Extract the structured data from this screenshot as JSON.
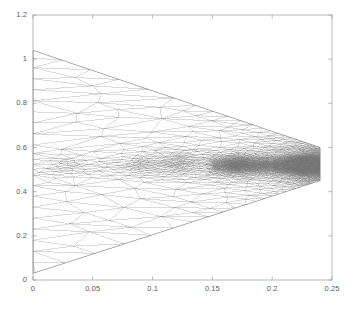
{
  "figure": {
    "background_color": "#ffffff",
    "axes_color": "#9a9a9a",
    "mesh_color": "#707070",
    "tick_label_color": "#5a5a5a",
    "title": "",
    "xlabel": "",
    "ylabel": ""
  },
  "chart_data": {
    "type": "line",
    "plot_kind": "triangular-finite-element-mesh",
    "title": "",
    "xlabel": "",
    "ylabel": "",
    "xlim": [
      0,
      0.25
    ],
    "ylim": [
      0,
      1.2
    ],
    "xticks": [
      0,
      0.05,
      0.1,
      0.15,
      0.2,
      0.25
    ],
    "xticklabels": [
      "0",
      "0.05",
      "0.1",
      "0.15",
      "0.2",
      "0.25"
    ],
    "yticks": [
      0,
      0.2,
      0.4,
      0.6,
      0.8,
      1,
      1.2
    ],
    "yticklabels": [
      "0",
      "0.2",
      "0.4",
      "0.6",
      "0.8",
      "1",
      "1.2"
    ],
    "grid": false,
    "legend": null,
    "box": true,
    "tick_direction": "in",
    "domain": {
      "shape": "wedge",
      "description": "Triangular mesh filling a wedge that is tall at x=0 and converges to a narrow band at x=0.24",
      "boundary_vertices": [
        [
          0.0,
          1.04
        ],
        [
          0.24,
          0.6
        ],
        [
          0.24,
          0.45
        ],
        [
          0.0,
          0.03
        ]
      ],
      "upper_edge": [
        [
          0.0,
          1.04
        ],
        [
          0.24,
          0.6
        ]
      ],
      "lower_edge": [
        [
          0.0,
          0.03
        ],
        [
          0.24,
          0.45
        ]
      ],
      "left_edge": [
        [
          0.0,
          0.03
        ],
        [
          0.0,
          1.04
        ]
      ],
      "right_edge": [
        [
          0.24,
          0.45
        ],
        [
          0.24,
          0.6
        ]
      ]
    },
    "refinement": {
      "description": "Adaptive h-refinement; element size shrinks toward the right tip and along the horizontal band near y = 0.5",
      "refined_bands": [
        {
          "y_center": 0.52,
          "y_half_width": 0.09,
          "x_range": [
            0.0,
            0.24
          ]
        },
        {
          "y_center": 0.52,
          "y_half_width": 0.05,
          "x_range": [
            0.15,
            0.24
          ]
        }
      ],
      "dense_clusters": [
        {
          "x": 0.005,
          "y": 0.95,
          "radius": 0.02
        },
        {
          "x": 0.01,
          "y": 0.4,
          "radius": 0.03
        },
        {
          "x": 0.03,
          "y": 0.52,
          "radius": 0.02
        },
        {
          "x": 0.09,
          "y": 0.53,
          "radius": 0.025
        },
        {
          "x": 0.125,
          "y": 0.55,
          "radius": 0.02
        },
        {
          "x": 0.17,
          "y": 0.52,
          "radius": 0.02
        },
        {
          "x": 0.225,
          "y": 0.52,
          "radius": 0.018
        }
      ],
      "min_element_size": 0.0008,
      "max_element_size": 0.05
    }
  }
}
